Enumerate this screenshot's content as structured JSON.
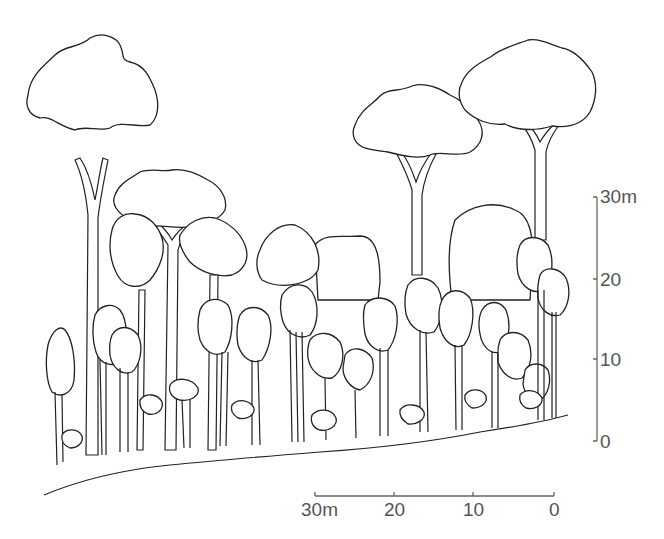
{
  "diagram": {
    "type": "forest-profile",
    "vertical_scale": {
      "unit": "m",
      "ticks": [
        {
          "label": "30m",
          "value": 30
        },
        {
          "label": "20",
          "value": 20
        },
        {
          "label": "10",
          "value": 10
        },
        {
          "label": "0",
          "value": 0
        }
      ]
    },
    "horizontal_scale": {
      "unit": "m",
      "ticks": [
        {
          "label": "30m",
          "value": 30
        },
        {
          "label": "20",
          "value": 20
        },
        {
          "label": "10",
          "value": 10
        },
        {
          "label": "0",
          "value": 0
        }
      ]
    },
    "line_color": "#222222",
    "scale_color": "#666666"
  }
}
